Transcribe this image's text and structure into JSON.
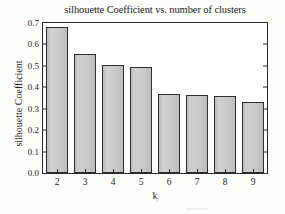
{
  "figure": {
    "background_color": "#fdfdfc",
    "frame_color": "#2b2b2b"
  },
  "chart_data": {
    "type": "bar",
    "title": "silhouette Coefficient vs. number of clusters",
    "xlabel": "k",
    "ylabel": "silhouette Coefficient",
    "categories": [
      "2",
      "3",
      "4",
      "5",
      "6",
      "7",
      "8",
      "9"
    ],
    "values": [
      0.68,
      0.555,
      0.502,
      0.494,
      0.371,
      0.362,
      0.358,
      0.332
    ],
    "ylim": [
      0.0,
      0.7
    ],
    "yticks": [
      "0.0",
      "0.1",
      "0.2",
      "0.3",
      "0.4",
      "0.5",
      "0.6",
      "0.7"
    ],
    "ytick_values": [
      0.0,
      0.1,
      0.2,
      0.3,
      0.4,
      0.5,
      0.6,
      0.7
    ],
    "grid": false,
    "legend": null,
    "bar_fill_color": "#c9c9c9",
    "bar_edge_color": "#2e2e2e"
  }
}
